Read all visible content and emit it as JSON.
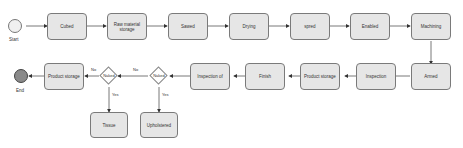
{
  "diagram": {
    "start_label": "Start",
    "end_label": "End",
    "top_row": [
      "Cubed",
      "Raw material storage",
      "Sawed",
      "Drying",
      "spred",
      "Enabled",
      "Machining"
    ],
    "bottom_row": [
      "Armed",
      "Inspection",
      "Product storage",
      "Finish",
      "Inspection of"
    ],
    "gateways": [
      {
        "label": "Naked",
        "yes_target": "Upholstered",
        "no_label": "No",
        "yes_label": "Yes"
      },
      {
        "label": "Naked",
        "yes_target": "Tissue",
        "no_label": "No",
        "yes_label": "Yes"
      }
    ],
    "final_storage": "Product storage",
    "branch_nodes": [
      "Upholstered",
      "Tissue"
    ],
    "colors": {
      "node_fill": "#e6e6e6",
      "node_border": "#7a7a7a",
      "end_fill": "#8a8a8a",
      "start_fill": "#f0f0f0"
    }
  }
}
